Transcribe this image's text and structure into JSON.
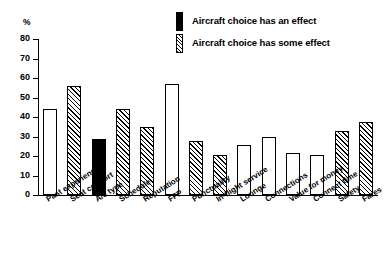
{
  "chart_data": {
    "type": "bar",
    "title": "",
    "subtitle": "",
    "xlabel": "",
    "ylabel": "%",
    "ylim": [
      0,
      80
    ],
    "ytick_step": 10,
    "yticks": [
      "80",
      "70",
      "60",
      "50",
      "40",
      "30",
      "20",
      "10",
      "0"
    ],
    "grid": false,
    "legend_position": "top-right",
    "categories": [
      "Past experience",
      "Seat comfort",
      "A/c type",
      "Schedule",
      "Reputation",
      "FFP",
      "Punctuality",
      "In-flight service",
      "Lounge",
      "Connections",
      "Value for money",
      "Connect time",
      "Safety",
      "Fares"
    ],
    "values": [
      44,
      56,
      28.5,
      44,
      35,
      57,
      27.5,
      20.5,
      25.5,
      29.5,
      21.5,
      20.5,
      33,
      37.5
    ],
    "fills": [
      "white",
      "hatch",
      "black",
      "hatch",
      "hatch",
      "white",
      "hatch",
      "hatch",
      "white",
      "white",
      "white",
      "white",
      "hatch",
      "hatch"
    ],
    "legend": [
      {
        "label": "Aircraft choice has an effect",
        "fill": "black"
      },
      {
        "label": "Aircraft choice has some effect",
        "fill": "hatch"
      }
    ],
    "colors": {
      "axis": "#000000",
      "bar_outline": "#000000",
      "bar_solid": "#000000",
      "bar_open": "#ffffff",
      "background": "#ffffff"
    }
  }
}
